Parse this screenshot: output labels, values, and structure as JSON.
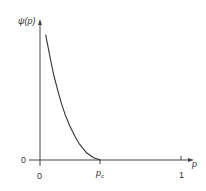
{
  "chart_data": {
    "type": "line",
    "title": "",
    "xlabel": "p",
    "ylabel": "ψ(p)",
    "x_ticks": [
      {
        "value": 0,
        "label": "0"
      },
      {
        "value": 0.43,
        "label": "p",
        "subscript": "c"
      },
      {
        "value": 1,
        "label": "1"
      }
    ],
    "y_ticks": [
      {
        "value": 0,
        "label": "0"
      }
    ],
    "xlim": [
      0,
      1.08
    ],
    "ylim": [
      0,
      1.0
    ],
    "grid": false,
    "legend": null,
    "series": [
      {
        "name": "ψ(p)",
        "x": [
          0.04,
          0.06,
          0.08,
          0.1,
          0.13,
          0.15,
          0.18,
          0.21,
          0.25,
          0.28,
          0.33,
          0.38,
          0.43,
          1.0
        ],
        "y": [
          0.87,
          0.77,
          0.67,
          0.58,
          0.47,
          0.4,
          0.31,
          0.24,
          0.16,
          0.11,
          0.05,
          0.015,
          0.0,
          0.0
        ]
      }
    ],
    "annotations": [
      "p_c marks the critical point where ψ(p) reaches 0 and remains 0 up to p = 1"
    ]
  },
  "labels": {
    "y_axis": "ψ(p)",
    "x_axis": "p",
    "y_zero": "0",
    "x_zero": "0",
    "pc_main": "p",
    "pc_sub": "c",
    "x_one": "1"
  },
  "colors": {
    "axis": "#444444",
    "curve": "#333333",
    "text": "#333333"
  }
}
